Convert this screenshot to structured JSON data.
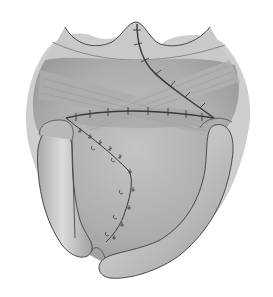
{
  "figure": {
    "type": "medical-illustration",
    "palette": {
      "background": "#ffffff",
      "tissue_light": "#cfcfcf",
      "tissue_mid": "#b4b4b4",
      "tissue_dark": "#9a9a9a",
      "outline": "#4a4a4a",
      "suture": "#3a3a3a",
      "flap_highlight": "#dcdcdc"
    },
    "elements": [
      {
        "name": "upper-tissue-arch",
        "description": "scalloped upper margin with central peak"
      },
      {
        "name": "crossing-muscle-bands",
        "description": "two crossing striated bands forming an X"
      },
      {
        "name": "horizontal-suture-line",
        "description": "horizontal running suture with tick marks"
      },
      {
        "name": "diagonal-suture-line",
        "description": "suture from top peak running diagonally down-right"
      },
      {
        "name": "lower-zigzag-suture",
        "description": "interrupted sutures along a bent incision in lower-left"
      },
      {
        "name": "left-curved-flap",
        "description": "vertical tubular fold on left side"
      },
      {
        "name": "right-curved-flap",
        "description": "curved tubular fold sweeping from right to bottom"
      }
    ]
  }
}
